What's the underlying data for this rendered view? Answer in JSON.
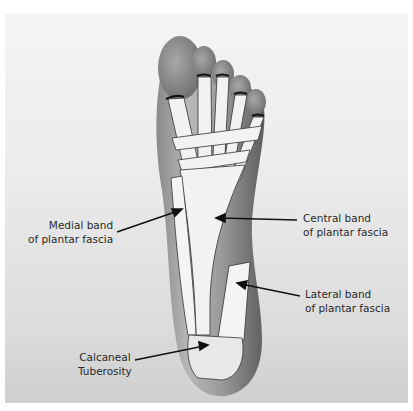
{
  "figure": {
    "labels": [
      {
        "id": "medial",
        "line1": "Medial band",
        "line2": "of plantar fascia"
      },
      {
        "id": "central",
        "line1": "Central band",
        "line2": "of plantar fascia"
      },
      {
        "id": "lateral",
        "line1": "Lateral band",
        "line2": "of plantar fascia"
      },
      {
        "id": "calcaneal",
        "line1": "Calcaneal",
        "line2": "Tuberosity"
      }
    ]
  },
  "colors": {
    "background": "#ffffff",
    "photo_bg": "#e6e6e6",
    "skin_dark": "#6e6e6e",
    "skin_light": "#bdbdbd",
    "fascia": "#f2f2f2",
    "outline": "#222222",
    "text": "#2a2a2a"
  }
}
